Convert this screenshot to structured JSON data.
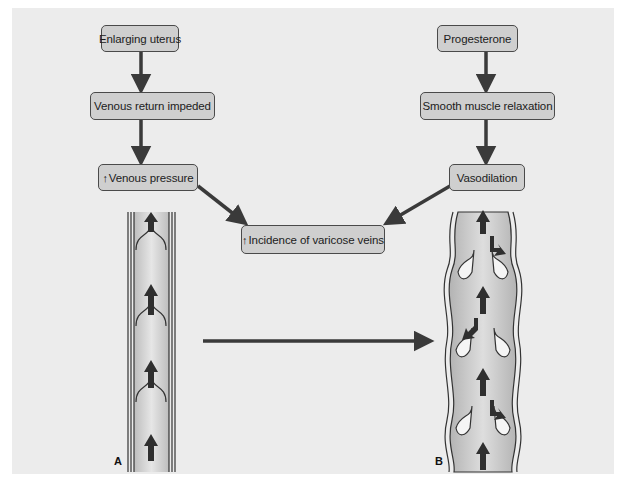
{
  "diagram": {
    "left_chain": {
      "boxes": [
        {
          "label": "Enlarging uterus"
        },
        {
          "label": "Venous return impeded"
        },
        {
          "prefix_symbol": "↑",
          "label": "Venous pressure"
        }
      ]
    },
    "right_chain": {
      "boxes": [
        {
          "label": "Progesterone"
        },
        {
          "label": "Smooth muscle relaxation"
        },
        {
          "label": "Vasodilation"
        }
      ]
    },
    "outcome": {
      "prefix_symbol": "↑",
      "label": "Incidence of varicose veins"
    },
    "panels": [
      {
        "id": "A",
        "label": "A",
        "description": "normal vein with competent valves, upward flow arrows"
      },
      {
        "id": "B",
        "label": "B",
        "description": "dilated varicose vein with incompetent valves, backflow arrows"
      }
    ],
    "transition_arrow": "A-to-B",
    "colors": {
      "background": "#ececec",
      "box_fill": "#cfcfcf",
      "box_border": "#4a4a4a",
      "arrow": "#3a3a3a"
    }
  }
}
